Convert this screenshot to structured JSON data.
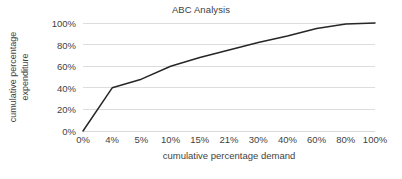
{
  "chart_data": {
    "type": "line",
    "title": "ABC Analysis",
    "xlabel": "cumulative percentage demand",
    "ylabel_lines": [
      "cumulative percentage",
      "expenditure"
    ],
    "ylabel": "cumulative percentage expenditure",
    "categories": [
      "0%",
      "4%",
      "5%",
      "10%",
      "15%",
      "21%",
      "30%",
      "40%",
      "60%",
      "80%",
      "100%"
    ],
    "values": [
      0,
      40,
      48,
      60,
      68,
      75,
      82,
      88,
      95,
      99,
      100
    ],
    "value_labels": [
      "0%",
      "40%",
      "48%",
      "60%",
      "68%",
      "75%",
      "82%",
      "88%",
      "95%",
      "99%",
      "100%"
    ],
    "yticks": [
      "0%",
      "20%",
      "40%",
      "60%",
      "80%",
      "100%"
    ],
    "ytick_values": [
      0,
      20,
      40,
      60,
      80,
      100
    ],
    "ylim": [
      0,
      100
    ],
    "grid": "horizontal",
    "legend": "none",
    "series": [
      {
        "name": "cumulative percentage expenditure",
        "values": [
          0,
          40,
          48,
          60,
          68,
          75,
          82,
          88,
          95,
          99,
          100
        ]
      }
    ],
    "colors": {
      "line": "#262626",
      "grid": "#d9d9d9",
      "axis": "#d9d9d9",
      "text": "#3f3f3f",
      "background": "#ffffff"
    }
  }
}
